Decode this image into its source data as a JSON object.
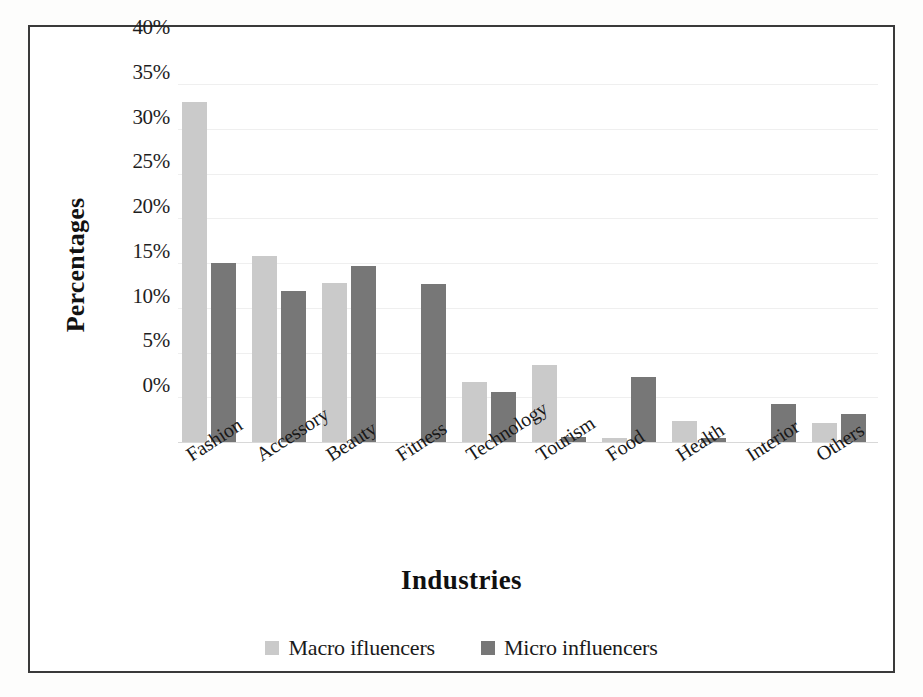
{
  "chart_data": {
    "type": "bar",
    "title": "",
    "subtitle": "",
    "xlabel": "Industries",
    "ylabel": "Percentages",
    "categories": [
      "Fashion",
      "Accessory",
      "Beauty",
      "Fitness",
      "Technology",
      "Tourism",
      "Food",
      "Health",
      "Interior",
      "Others"
    ],
    "series": [
      {
        "name": "Macro ifluencers",
        "color": "#cacaca",
        "values": [
          38.0,
          20.8,
          17.8,
          0.0,
          6.7,
          8.6,
          0.5,
          2.3,
          0.0,
          2.1
        ]
      },
      {
        "name": "Micro influencers",
        "color": "#777777",
        "values": [
          20.0,
          16.9,
          19.7,
          17.6,
          5.6,
          0.6,
          7.3,
          0.4,
          4.3,
          3.1
        ]
      }
    ],
    "ylim": [
      0,
      40
    ],
    "ytick_values": [
      0,
      5,
      10,
      15,
      20,
      25,
      30,
      35,
      40
    ],
    "ytick_labels": [
      "0%",
      "5%",
      "10%",
      "15%",
      "20%",
      "25%",
      "30%",
      "35%",
      "40%"
    ],
    "value_suffix": "%",
    "grid": true,
    "grid_axis": "y",
    "legend_position": "bottom",
    "xlabel_rotation": -33,
    "plot_background": "#ffffff",
    "border_color": "#3a3a3a"
  }
}
